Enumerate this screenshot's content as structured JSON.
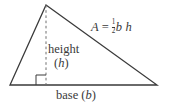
{
  "figure": {
    "type": "geometry-diagram",
    "canvas": {
      "width": 169,
      "height": 105,
      "background": "#ffffff"
    },
    "stroke_color": "#3a3a3a",
    "text_color": "#3a3a3a",
    "shape": {
      "name": "triangle",
      "vertices": [
        {
          "id": "apex",
          "x": 46,
          "y": 5
        },
        {
          "id": "bottom-left",
          "x": 10,
          "y": 85
        },
        {
          "id": "bottom-right",
          "x": 157,
          "y": 85
        }
      ],
      "altitude": {
        "style": "dashed",
        "from": {
          "x": 46,
          "y": 5
        },
        "to": {
          "x": 46,
          "y": 85
        }
      },
      "right_angle_marker": {
        "size": 10,
        "corner_x": 46,
        "corner_y": 85,
        "side": "left"
      }
    },
    "labels": {
      "height_word": "height",
      "height_open_paren": "(",
      "height_symbol": "h",
      "height_close_paren": ")",
      "base_word": "base",
      "base_open_paren": "(",
      "base_symbol": "b",
      "base_close_paren": ")"
    },
    "formula": {
      "area_symbol": "A",
      "equals": "=",
      "fraction_numerator": "1",
      "fraction_denominator": "2",
      "base_symbol": "b",
      "height_symbol": "h",
      "plain_text": "A = 1/2 b h"
    }
  }
}
